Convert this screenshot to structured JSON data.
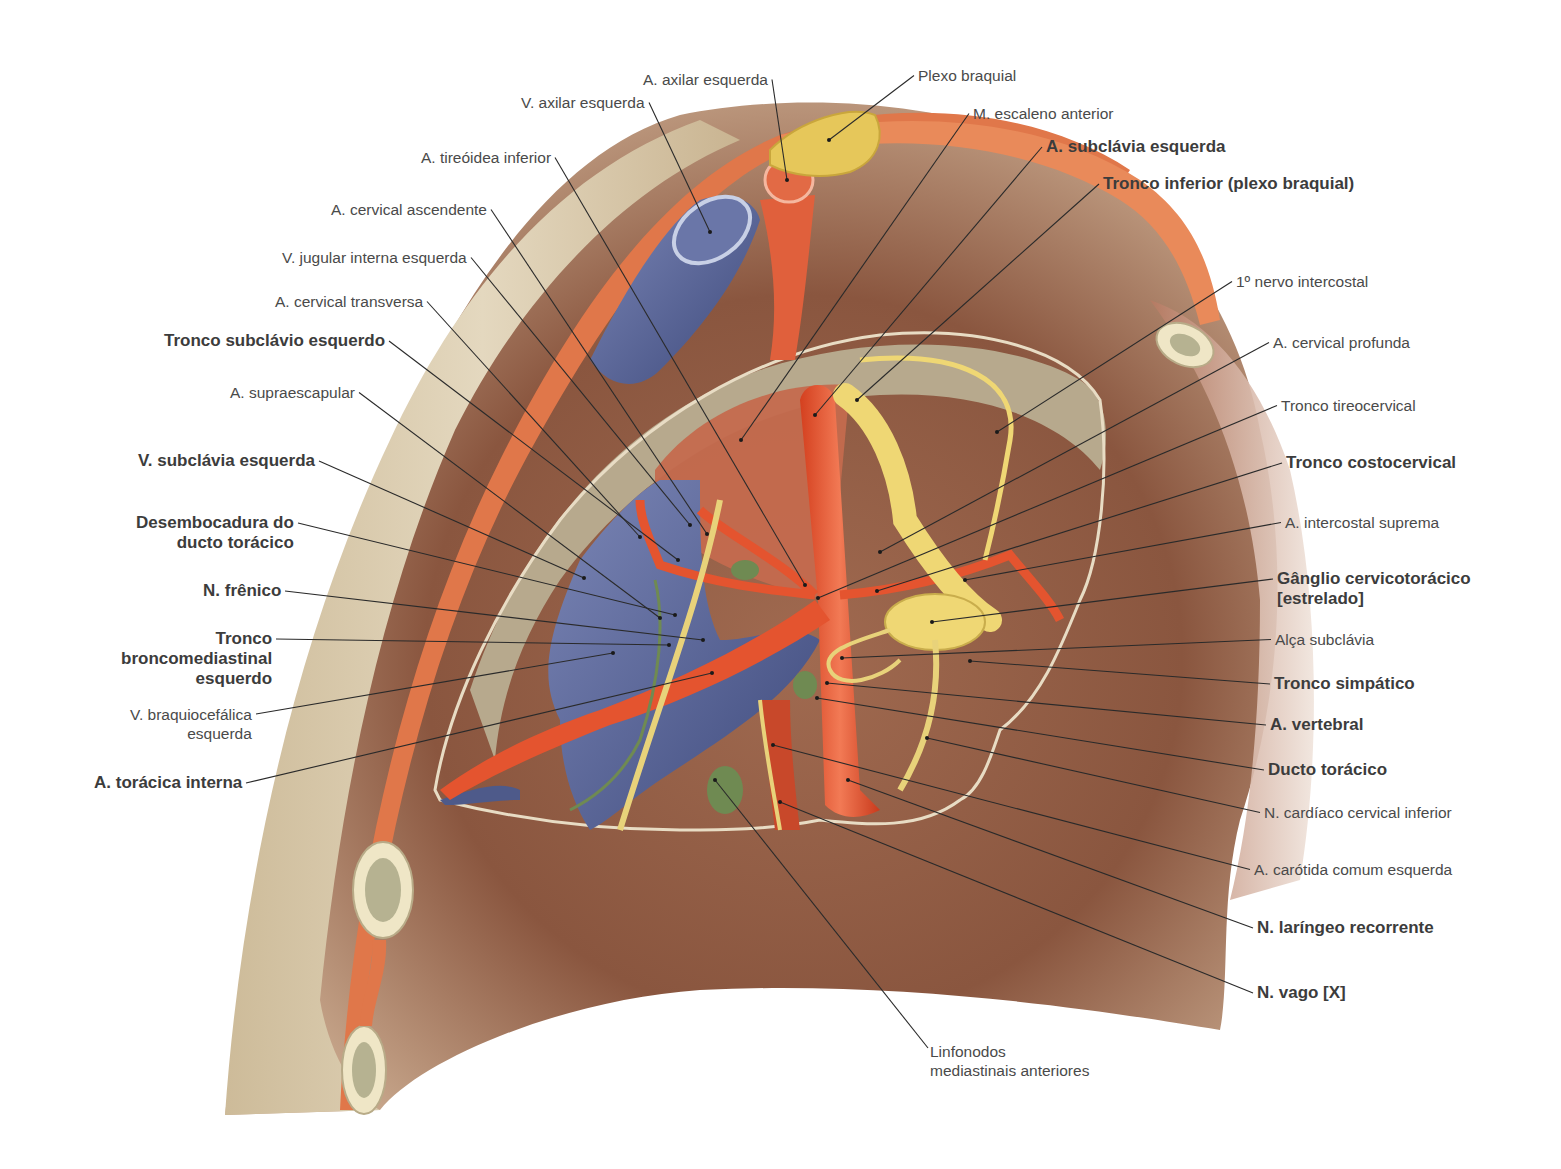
{
  "figure": {
    "language": "pt-BR",
    "signature": "Kiloba",
    "colors": {
      "artery": "#e4542f",
      "vein": "#5e6a9c",
      "nerve": "#e8d27a",
      "lymph": "#6f8a52",
      "muscle": "#c8644a",
      "pleura": "#b5a68c",
      "bone": "#efe6c6",
      "skin": "#d8cbb0",
      "background_cavity": "#8c5a42",
      "label_text": "#4a4a4a",
      "leader_line": "#2a2a2a"
    }
  },
  "labels_left": [
    {
      "id": "a-axilar-esquerda",
      "lines": [
        "A. axilar esquerda"
      ],
      "bold": false,
      "x": 768,
      "y": 70,
      "anchor": "right",
      "target": [
        787,
        180
      ]
    },
    {
      "id": "v-axilar-esquerda",
      "lines": [
        "V. axilar esquerda"
      ],
      "bold": false,
      "x": 645,
      "y": 93,
      "anchor": "right",
      "target": [
        710,
        232
      ]
    },
    {
      "id": "a-tireoidea-inferior",
      "lines": [
        "A. tireóidea inferior"
      ],
      "bold": false,
      "x": 551,
      "y": 148,
      "anchor": "right",
      "target": [
        805,
        585
      ]
    },
    {
      "id": "a-cervical-ascendente",
      "lines": [
        "A. cervical ascendente"
      ],
      "bold": false,
      "x": 487,
      "y": 200,
      "anchor": "right",
      "target": [
        707,
        534
      ]
    },
    {
      "id": "v-jugular-interna-esquerda",
      "lines": [
        "V. jugular interna esquerda"
      ],
      "bold": false,
      "x": 467,
      "y": 248,
      "anchor": "right",
      "target": [
        690,
        525
      ]
    },
    {
      "id": "a-cervical-transversa",
      "lines": [
        "A. cervical transversa"
      ],
      "bold": false,
      "x": 423,
      "y": 292,
      "anchor": "right",
      "target": [
        640,
        537
      ]
    },
    {
      "id": "tronco-subclavio-esquerdo",
      "lines": [
        "Tronco subclávio esquerdo"
      ],
      "bold": true,
      "x": 385,
      "y": 331,
      "anchor": "right",
      "target": [
        678,
        560
      ]
    },
    {
      "id": "a-supraescapular",
      "lines": [
        "A. supraescapular"
      ],
      "bold": false,
      "x": 355,
      "y": 383,
      "anchor": "right",
      "target": [
        660,
        618
      ]
    },
    {
      "id": "v-subclavia-esquerda",
      "lines": [
        "V. subclávia esquerda"
      ],
      "bold": true,
      "x": 315,
      "y": 451,
      "anchor": "right",
      "target": [
        584,
        578
      ]
    },
    {
      "id": "desembocadura-ducto-toracico",
      "lines": [
        "Desembocadura do",
        "ducto torácico"
      ],
      "bold": true,
      "x": 294,
      "y": 513,
      "anchor": "right",
      "target": [
        675,
        615
      ]
    },
    {
      "id": "n-frenico",
      "lines": [
        "N. frênico"
      ],
      "bold": true,
      "x": 281,
      "y": 581,
      "anchor": "right",
      "target": [
        703,
        640
      ]
    },
    {
      "id": "tronco-broncomediastinal-esquerdo",
      "lines": [
        "Tronco",
        "broncomediastinal",
        "esquerdo"
      ],
      "bold": true,
      "x": 272,
      "y": 629,
      "anchor": "right",
      "target": [
        669,
        645
      ]
    },
    {
      "id": "v-braquiocefalica-esquerda",
      "lines": [
        "V. braquiocefálica",
        "esquerda"
      ],
      "bold": false,
      "x": 252,
      "y": 705,
      "anchor": "right",
      "target": [
        613,
        653
      ]
    },
    {
      "id": "a-toracica-interna",
      "lines": [
        "A. torácica interna"
      ],
      "bold": true,
      "x": 242,
      "y": 773,
      "anchor": "right",
      "target": [
        712,
        673
      ]
    }
  ],
  "labels_right": [
    {
      "id": "plexo-braquial",
      "lines": [
        "Plexo braquial"
      ],
      "bold": false,
      "x": 918,
      "y": 66,
      "anchor": "left",
      "target": [
        829,
        140
      ]
    },
    {
      "id": "m-escaleno-anterior",
      "lines": [
        "M. escaleno anterior"
      ],
      "bold": false,
      "x": 973,
      "y": 104,
      "anchor": "left",
      "target": [
        741,
        440
      ]
    },
    {
      "id": "a-subclavia-esquerda",
      "lines": [
        "A. subclávia esquerda"
      ],
      "bold": true,
      "x": 1046,
      "y": 137,
      "anchor": "left",
      "target": [
        815,
        415
      ]
    },
    {
      "id": "tronco-inferior-plexo-braquial",
      "lines": [
        "Tronco inferior (plexo braquial)"
      ],
      "bold": true,
      "x": 1103,
      "y": 174,
      "anchor": "left",
      "target": [
        857,
        400
      ]
    },
    {
      "id": "primeiro-nervo-intercostal",
      "lines": [
        "1º nervo intercostal"
      ],
      "bold": false,
      "x": 1236,
      "y": 272,
      "anchor": "left",
      "target": [
        997,
        432
      ]
    },
    {
      "id": "a-cervical-profunda",
      "lines": [
        "A. cervical profunda"
      ],
      "bold": false,
      "x": 1273,
      "y": 333,
      "anchor": "left",
      "target": [
        880,
        552
      ]
    },
    {
      "id": "tronco-tireocervical",
      "lines": [
        "Tronco tireocervical"
      ],
      "bold": false,
      "x": 1281,
      "y": 396,
      "anchor": "left",
      "target": [
        818,
        598
      ]
    },
    {
      "id": "tronco-costocervical",
      "lines": [
        "Tronco costocervical"
      ],
      "bold": true,
      "x": 1286,
      "y": 453,
      "anchor": "left",
      "target": [
        877,
        591
      ]
    },
    {
      "id": "a-intercostal-suprema",
      "lines": [
        "A. intercostal suprema"
      ],
      "bold": false,
      "x": 1285,
      "y": 513,
      "anchor": "left",
      "target": [
        965,
        580
      ]
    },
    {
      "id": "ganglio-cervicotoracico",
      "lines": [
        "Gânglio cervicotorácico",
        "[estrelado]"
      ],
      "bold": true,
      "x": 1277,
      "y": 569,
      "anchor": "left",
      "target": [
        932,
        622
      ]
    },
    {
      "id": "alca-subclavia",
      "lines": [
        "Alça subclávia"
      ],
      "bold": false,
      "x": 1275,
      "y": 630,
      "anchor": "left",
      "target": [
        842,
        658
      ]
    },
    {
      "id": "tronco-simpatico",
      "lines": [
        "Tronco simpático"
      ],
      "bold": true,
      "x": 1274,
      "y": 674,
      "anchor": "left",
      "target": [
        970,
        661
      ]
    },
    {
      "id": "a-vertebral",
      "lines": [
        "A. vertebral"
      ],
      "bold": true,
      "x": 1270,
      "y": 715,
      "anchor": "left",
      "target": [
        827,
        683
      ]
    },
    {
      "id": "ducto-toracico",
      "lines": [
        "Ducto torácico"
      ],
      "bold": true,
      "x": 1268,
      "y": 760,
      "anchor": "left",
      "target": [
        817,
        698
      ]
    },
    {
      "id": "n-cardiaco-cervical-inferior",
      "lines": [
        "N. cardíaco cervical inferior"
      ],
      "bold": false,
      "x": 1264,
      "y": 803,
      "anchor": "left",
      "target": [
        927,
        738
      ]
    },
    {
      "id": "a-carotida-comum-esquerda",
      "lines": [
        "A. carótida comum esquerda"
      ],
      "bold": false,
      "x": 1254,
      "y": 860,
      "anchor": "left",
      "target": [
        773,
        745
      ]
    },
    {
      "id": "n-laringeo-recorrente",
      "lines": [
        "N. laríngeo recorrente"
      ],
      "bold": true,
      "x": 1257,
      "y": 918,
      "anchor": "left",
      "target": [
        848,
        780
      ]
    },
    {
      "id": "n-vago",
      "lines": [
        "N. vago [X]"
      ],
      "bold": true,
      "x": 1257,
      "y": 983,
      "anchor": "left",
      "target": [
        780,
        802
      ]
    }
  ],
  "labels_bottom": [
    {
      "id": "linfonodos-mediastinais-anteriores",
      "lines": [
        "Linfonodos",
        "mediastinais anteriores"
      ],
      "bold": false,
      "x": 930,
      "y": 1042,
      "anchor": "left",
      "target": [
        715,
        780
      ]
    }
  ]
}
